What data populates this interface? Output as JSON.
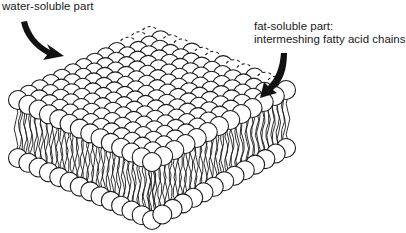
{
  "diagram": {
    "labels": {
      "water_soluble": "water-soluble part",
      "fat_soluble_line1": "fat-soluble part:",
      "fat_soluble_line2": "intermeshing fatty acid chains"
    },
    "colors": {
      "stroke": "#1a1a1a",
      "fill": "#ffffff",
      "arrow": "#111111"
    },
    "geometry": {
      "top_face": {
        "top": [
          150,
          36
        ],
        "left": [
          18,
          100
        ],
        "right": [
          286,
          90
        ],
        "front": [
          152,
          162
        ]
      },
      "slab_depth": 58,
      "head_radius": 9.5,
      "grid_rows": 12,
      "grid_cols": 13
    }
  }
}
